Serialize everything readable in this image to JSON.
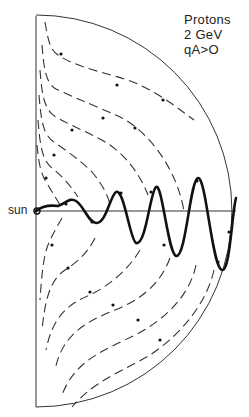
{
  "figure": {
    "title_lines": [
      "Protons",
      "2 GeV",
      "qA>O"
    ],
    "sun_label": "sun",
    "colors": {
      "ink": "#222222",
      "background": "#ffffff"
    },
    "boundary": {
      "center": [
        36,
        211
      ],
      "radius": 196,
      "axis_top": 16,
      "axis_bottom": 407
    },
    "current_sheet_line": {
      "y": 211,
      "x_start": 36,
      "x_end": 236
    },
    "drift_streamlines_upper": [
      "M45,22 C48,40 50,50 58,55 C80,70 120,75 140,85 C165,97 180,110 194,120",
      "M42,45 C44,70 46,85 58,90 C80,100 100,108 118,116 C140,126 160,150 170,170 C178,185 182,200 184,211",
      "M40,70 C42,95 44,110 56,117 C75,128 95,135 110,145 C128,158 140,175 148,195",
      "M39,95 C41,120 43,135 54,142 C68,152 80,160 92,172 C102,184 108,195 110,205",
      "M38,120 C40,145 42,160 52,168 C62,176 70,185 78,197",
      "M37,145 C39,165 41,175 48,185 C52,192 56,198 60,205"
    ],
    "drift_streamlines_lower": [
      "M62,218 C58,225 52,235 48,245 C44,255 42,270 40,300",
      "M95,238 C88,252 78,262 65,270 C50,280 45,300 42,330",
      "M140,250 C128,270 110,285 90,295 C65,305 52,320 46,350",
      "M170,258 C160,285 140,300 115,310 C85,322 62,335 55,370",
      "M196,265 C190,295 165,320 135,335 C105,350 75,360 62,395",
      "M214,270 C206,305 180,335 150,355 C125,370 95,380 72,407"
    ],
    "trajectory_path": "M36,211 C42,206 50,205 58,206 C66,203 70,197 76,201 C84,206 88,222 96,223 C106,224 110,196 116,192 C124,188 130,240 136,243 C146,246 150,192 156,187 C162,182 168,253 176,256 C186,258 190,180 198,178 C206,176 212,268 222,270 C230,272 232,212 236,198",
    "arrow_markers": [
      [
        61,
        54
      ],
      [
        117,
        85
      ],
      [
        163,
        100
      ],
      [
        135,
        128
      ],
      [
        103,
        118
      ],
      [
        72,
        130
      ],
      [
        54,
        155
      ],
      [
        46,
        178
      ],
      [
        52,
        245
      ],
      [
        68,
        268
      ],
      [
        90,
        292
      ],
      [
        113,
        305
      ],
      [
        138,
        320
      ],
      [
        160,
        340
      ],
      [
        66,
        204
      ],
      [
        92,
        222
      ],
      [
        121,
        193
      ],
      [
        151,
        192
      ],
      [
        164,
        245
      ],
      [
        197,
        181
      ],
      [
        218,
        262
      ],
      [
        229,
        232
      ]
    ]
  }
}
